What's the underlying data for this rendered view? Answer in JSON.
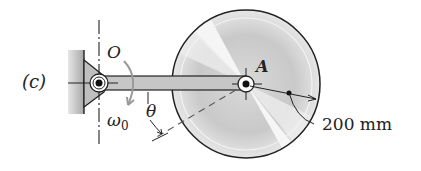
{
  "figure": {
    "part_label": "(c)",
    "pivot_label": "O",
    "disk_center_label": "A",
    "angular_velocity_label": "ω",
    "angular_velocity_subscript": "0",
    "angle_label": "θ",
    "radius_label": "200 mm"
  },
  "colors": {
    "wall": "#b5b5b5",
    "arm": "#c8c8c8",
    "outline": "#222222",
    "disk_light": "#f2f2f2",
    "disk_dark": "#bdbdbd",
    "arrow_gray": "#9a9a9a"
  }
}
